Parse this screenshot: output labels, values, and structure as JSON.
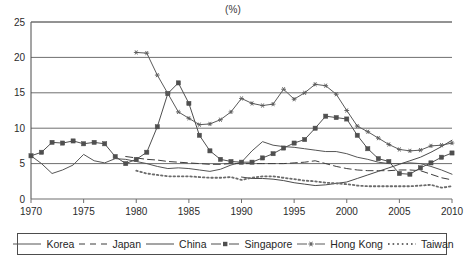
{
  "chart_data": {
    "type": "line",
    "title": "(%)",
    "xlabel": "",
    "ylabel": "",
    "xlim": [
      1970,
      2010
    ],
    "ylim": [
      0,
      25
    ],
    "ytick_values": [
      0,
      5,
      10,
      15,
      20,
      25
    ],
    "ytick_labels": [
      "0",
      "5",
      "10",
      "15",
      "20",
      "25"
    ],
    "xtick_values": [
      1970,
      1975,
      1980,
      1985,
      1990,
      1995,
      2000,
      2005,
      2010
    ],
    "xtick_labels": [
      "1970",
      "1975",
      "1980",
      "1985",
      "1990",
      "1995",
      "2000",
      "2005",
      "2010"
    ],
    "grid": "horizontal",
    "legend_position": "bottom",
    "series": [
      {
        "name": "Korea",
        "style": "solid",
        "marker": "none",
        "color": "#555555",
        "x": [
          1970,
          1971,
          1972,
          1973,
          1974,
          1975,
          1976,
          1977,
          1978,
          1979,
          1980,
          1981,
          1982,
          1983,
          1984,
          1985,
          1986,
          1987,
          1988,
          1989,
          1990,
          1991,
          1992,
          1993,
          1994,
          1995,
          1996,
          1997,
          1998,
          1999,
          2000,
          2001,
          2002,
          2003,
          2004,
          2005,
          2006,
          2007,
          2008,
          2009,
          2010
        ],
        "y": [
          6.1,
          5.0,
          3.6,
          4.1,
          4.8,
          6.3,
          5.4,
          5.1,
          5.7,
          5.6,
          5.3,
          5.0,
          4.6,
          4.3,
          4.4,
          4.3,
          4.1,
          3.9,
          4.2,
          4.8,
          5.2,
          6.8,
          8.1,
          7.6,
          7.4,
          7.3,
          7.1,
          6.9,
          6.7,
          6.7,
          6.4,
          5.9,
          5.6,
          5.2,
          5.0,
          5.0,
          5.1,
          5.0,
          4.6,
          4.1,
          3.5
        ]
      },
      {
        "name": "Japan",
        "style": "dashed",
        "marker": "none",
        "color": "#3d3d3d",
        "x": [
          1979,
          1980,
          1981,
          1982,
          1983,
          1984,
          1985,
          1986,
          1987,
          1988,
          1989,
          1990,
          1991,
          1992,
          1993,
          1994,
          1995,
          1996,
          1997,
          1998,
          1999,
          2000,
          2001,
          2002,
          2003,
          2004,
          2005,
          2006,
          2007,
          2008,
          2009,
          2010
        ],
        "y": [
          6.0,
          5.8,
          5.6,
          5.5,
          5.3,
          5.2,
          5.1,
          5.0,
          4.9,
          4.9,
          5.0,
          5.0,
          5.0,
          5.0,
          5.0,
          5.0,
          5.1,
          5.2,
          5.4,
          5.0,
          4.6,
          4.3,
          4.1,
          4.0,
          4.0,
          4.0,
          4.1,
          4.1,
          4.0,
          3.5,
          3.0,
          2.7
        ]
      },
      {
        "name": "China",
        "style": "solid",
        "marker": "none",
        "color": "#4a4a4a",
        "x": [
          1990,
          1991,
          1992,
          1993,
          1994,
          1995,
          1996,
          1997,
          1998,
          1999,
          2000,
          2001,
          2002,
          2003,
          2004,
          2005,
          2006,
          2007,
          2008,
          2009,
          2010
        ],
        "y": [
          3.1,
          2.9,
          2.9,
          2.8,
          2.6,
          2.3,
          2.1,
          1.9,
          2.0,
          2.2,
          2.4,
          2.9,
          3.4,
          3.9,
          4.4,
          4.9,
          5.4,
          5.9,
          6.6,
          7.4,
          8.3
        ]
      },
      {
        "name": "Singapore",
        "style": "solid",
        "marker": "square",
        "color": "#4f4f4f",
        "x": [
          1970,
          1971,
          1972,
          1973,
          1974,
          1975,
          1976,
          1977,
          1978,
          1979,
          1980,
          1981,
          1982,
          1983,
          1984,
          1985,
          1986,
          1987,
          1988,
          1989,
          1990,
          1991,
          1992,
          1993,
          1994,
          1995,
          1996,
          1997,
          1998,
          1999,
          2000,
          2001,
          2002,
          2003,
          2004,
          2005,
          2006,
          2007,
          2008,
          2009,
          2010
        ],
        "y": [
          6.1,
          6.6,
          8.0,
          7.9,
          8.2,
          7.8,
          8.0,
          7.8,
          6.0,
          5.0,
          5.6,
          6.6,
          10.2,
          14.9,
          16.4,
          13.5,
          9.0,
          6.8,
          5.6,
          5.3,
          5.2,
          5.2,
          5.8,
          6.4,
          7.2,
          7.9,
          8.4,
          10.0,
          11.7,
          11.5,
          11.3,
          9.0,
          7.1,
          5.7,
          5.3,
          3.6,
          3.5,
          4.4,
          5.1,
          5.9,
          6.5
        ]
      },
      {
        "name": "Hong Kong",
        "style": "solid",
        "marker": "star",
        "color": "#5a5a5a",
        "x": [
          1980,
          1981,
          1982,
          1983,
          1984,
          1985,
          1986,
          1987,
          1988,
          1989,
          1990,
          1991,
          1992,
          1993,
          1994,
          1995,
          1996,
          1997,
          1998,
          1999,
          2000,
          2001,
          2002,
          2003,
          2004,
          2005,
          2006,
          2007,
          2008,
          2009,
          2010
        ],
        "y": [
          20.7,
          20.6,
          17.5,
          14.9,
          12.3,
          11.4,
          10.5,
          10.6,
          11.2,
          12.3,
          14.2,
          13.5,
          13.2,
          13.4,
          15.5,
          14.1,
          15.0,
          16.2,
          16.0,
          14.8,
          12.5,
          10.3,
          9.5,
          8.6,
          7.7,
          7.0,
          6.8,
          6.9,
          7.5,
          7.6,
          7.9
        ]
      },
      {
        "name": "Taiwan",
        "style": "dotted",
        "marker": "none",
        "color": "#6b6b6b",
        "x": [
          1980,
          1981,
          1982,
          1983,
          1984,
          1985,
          1986,
          1987,
          1988,
          1989,
          1990,
          1991,
          1992,
          1993,
          1994,
          1995,
          1996,
          1997,
          1998,
          1999,
          2000,
          2001,
          2002,
          2003,
          2004,
          2005,
          2006,
          2007,
          2008,
          2009,
          2010
        ],
        "y": [
          4.0,
          3.6,
          3.4,
          3.2,
          3.2,
          3.2,
          3.1,
          3.0,
          3.0,
          3.1,
          2.7,
          3.0,
          3.2,
          3.2,
          3.0,
          2.8,
          2.6,
          2.5,
          2.3,
          2.2,
          2.1,
          1.9,
          1.8,
          1.8,
          1.8,
          1.8,
          1.8,
          1.9,
          2.0,
          1.6,
          1.8
        ]
      }
    ]
  },
  "legend": {
    "items": [
      {
        "label": "Korea",
        "swatch": "solid-line-swatch"
      },
      {
        "label": "Japan",
        "swatch": "dashed-line-swatch"
      },
      {
        "label": "China",
        "swatch": "solid-line-swatch"
      },
      {
        "label": "Singapore",
        "swatch": "square-marker-line-swatch"
      },
      {
        "label": "Hong Kong",
        "swatch": "star-marker-line-swatch"
      },
      {
        "label": "Taiwan",
        "swatch": "dotted-line-swatch"
      }
    ]
  }
}
